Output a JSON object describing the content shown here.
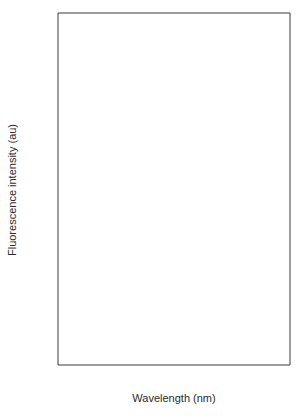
{
  "chart_data": {
    "type": "line",
    "title": "",
    "subtitle": "",
    "xlabel": "Wavelength (nm)",
    "ylabel": "Fluorescence intensity (au)",
    "xlim": [
      200,
      555
    ],
    "ylim": [
      -12,
      112
    ],
    "grid": false,
    "legend_position": "inline-annotations",
    "xticks": [
      200,
      250,
      300,
      350,
      400,
      450,
      500,
      550
    ],
    "xtick_labels": [
      "200",
      "250",
      "300",
      "350",
      "400",
      "450",
      "500",
      "550"
    ],
    "xminor_ticks": [
      225,
      275,
      325,
      375,
      425,
      475,
      525
    ],
    "yticks": [
      0,
      20,
      40,
      60,
      80,
      100
    ],
    "ytick_labels": [
      "0",
      "20",
      "40",
      "60",
      "80",
      "100"
    ],
    "yminor_ticks": [
      10,
      30,
      50,
      70,
      90
    ],
    "annotations": [
      {
        "text": "a",
        "x": 245,
        "y": 105
      },
      {
        "text": "b",
        "x": 298,
        "y": 98
      },
      {
        "text": "c",
        "x": 478,
        "y": 92
      }
    ],
    "series": [
      {
        "name": "a",
        "style": "solid",
        "color": "#7c7c7c",
        "x": [
          240,
          245,
          250,
          255,
          258,
          261,
          264,
          266,
          268,
          271,
          274,
          278,
          282,
          286,
          290,
          295,
          300,
          305,
          310,
          313,
          317,
          322,
          327,
          332,
          337,
          342,
          347,
          352,
          357,
          362,
          367,
          372,
          377,
          382,
          387,
          392,
          397,
          402,
          407,
          412,
          417,
          422,
          428,
          434,
          440,
          446,
          450
        ],
        "y": [
          50,
          56,
          66,
          84,
          92,
          97,
          99.5,
          100,
          99,
          94,
          86,
          73,
          60,
          48,
          39,
          29,
          23,
          19,
          17.3,
          17,
          17.6,
          20,
          23.5,
          26.8,
          29.5,
          31.2,
          32,
          32.3,
          32,
          31,
          29.2,
          26.8,
          23.8,
          20.5,
          17,
          13.5,
          10.5,
          7.8,
          5.6,
          4,
          2.8,
          1.9,
          1.2,
          0.7,
          0.4,
          0.15,
          0
        ]
      },
      {
        "name": "b",
        "style": "dotted",
        "color": "#8c8c8c",
        "x": [
          240,
          245,
          250,
          255,
          260,
          264,
          268,
          271,
          274,
          277,
          280,
          283,
          286,
          290,
          294,
          298,
          303,
          308,
          313,
          318,
          322,
          327,
          332,
          337,
          342,
          347,
          352,
          357,
          362,
          367,
          372,
          377,
          381,
          385,
          388,
          391,
          394,
          397,
          400,
          404,
          408,
          412,
          416,
          420,
          425,
          430,
          436,
          442
        ],
        "y": [
          43,
          45,
          49,
          56,
          68,
          80,
          91,
          96,
          99,
          100,
          99.6,
          97,
          92,
          83,
          71,
          59,
          46,
          35,
          29,
          26,
          25.2,
          26.5,
          30,
          35,
          40,
          44.5,
          48.5,
          51.5,
          53.5,
          55,
          56,
          56.8,
          57,
          56.5,
          55,
          52,
          47,
          41,
          34,
          25,
          17,
          11,
          7,
          4.5,
          2.6,
          1.4,
          0.6,
          0
        ]
      },
      {
        "name": "c",
        "style": "solid",
        "color": "#7c7c7c",
        "x": [
          410,
          414,
          418,
          421,
          424,
          427,
          430,
          433,
          436,
          439,
          442,
          445,
          448,
          452,
          456,
          459,
          462,
          465,
          468,
          471,
          474,
          478,
          482,
          486,
          490,
          495,
          500,
          505,
          510,
          515,
          520,
          525,
          530,
          535,
          540,
          545,
          550
        ],
        "y": [
          0.5,
          1.5,
          3.5,
          6,
          10,
          16,
          24,
          33,
          43,
          53,
          63,
          73,
          82,
          90,
          96,
          98.5,
          99.7,
          100,
          99.6,
          98.5,
          96.5,
          93,
          88,
          82.5,
          76,
          67,
          58,
          50,
          43,
          37,
          31.5,
          26.5,
          22.5,
          19,
          16,
          13.5,
          12
        ]
      }
    ]
  }
}
